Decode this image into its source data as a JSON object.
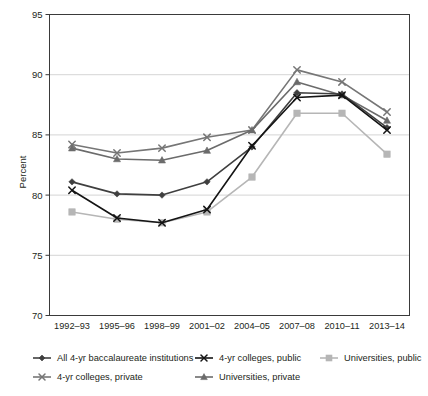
{
  "chart_data": {
    "type": "line",
    "title": "",
    "xlabel": "",
    "ylabel": "Percent",
    "ylim": [
      70,
      95
    ],
    "ytick_labels": [
      "70",
      "75",
      "80",
      "85",
      "90",
      "95"
    ],
    "yticks": [
      70,
      75,
      80,
      85,
      90,
      95
    ],
    "grid": true,
    "legend_position": "bottom",
    "categories": [
      "1992–93",
      "1995–96",
      "1998–99",
      "2001–02",
      "2004–05",
      "2007–08",
      "2010–11",
      "2013–14"
    ],
    "series": [
      {
        "name": "All 4-yr baccalaureate institutions",
        "marker": "diamond",
        "color": "#3f3f3f",
        "values": [
          81.1,
          80.1,
          80.0,
          81.1,
          84.0,
          88.5,
          88.4,
          85.6
        ]
      },
      {
        "name": "4-yr colleges, public",
        "marker": "x",
        "color": "#141414",
        "values": [
          80.4,
          78.1,
          77.7,
          78.8,
          84.1,
          88.1,
          88.3,
          85.4
        ]
      },
      {
        "name": "Universities, public",
        "marker": "square",
        "color": "#b6b6b6",
        "values": [
          78.6,
          78.0,
          77.7,
          78.6,
          81.5,
          86.8,
          86.8,
          83.4
        ]
      },
      {
        "name": "4-yr colleges, private",
        "marker": "x",
        "color": "#767676",
        "values": [
          84.2,
          83.5,
          83.9,
          84.8,
          85.4,
          90.4,
          89.4,
          86.9
        ]
      },
      {
        "name": "Universities, private",
        "marker": "triangle",
        "color": "#6b6b6b",
        "values": [
          83.9,
          83.0,
          82.9,
          83.7,
          85.4,
          89.4,
          88.3,
          86.2
        ]
      }
    ],
    "legend_rows": [
      [
        "All 4-yr baccalaureate institutions",
        "4-yr colleges, public",
        "Universities, public"
      ],
      [
        "4-yr colleges, private",
        "Universities, private"
      ]
    ]
  }
}
